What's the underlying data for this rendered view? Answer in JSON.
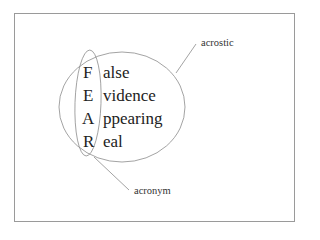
{
  "diagram": {
    "acronym_letters": [
      "F",
      "E",
      "A",
      "R"
    ],
    "words": [
      "alse",
      "vidence",
      "ppearing",
      "eal"
    ],
    "labels": {
      "acrostic": "acrostic",
      "acronym": "acronym"
    },
    "colors": {
      "line": "#8c8c8c",
      "text": "#222222",
      "frame": "#9a9a9a"
    }
  }
}
